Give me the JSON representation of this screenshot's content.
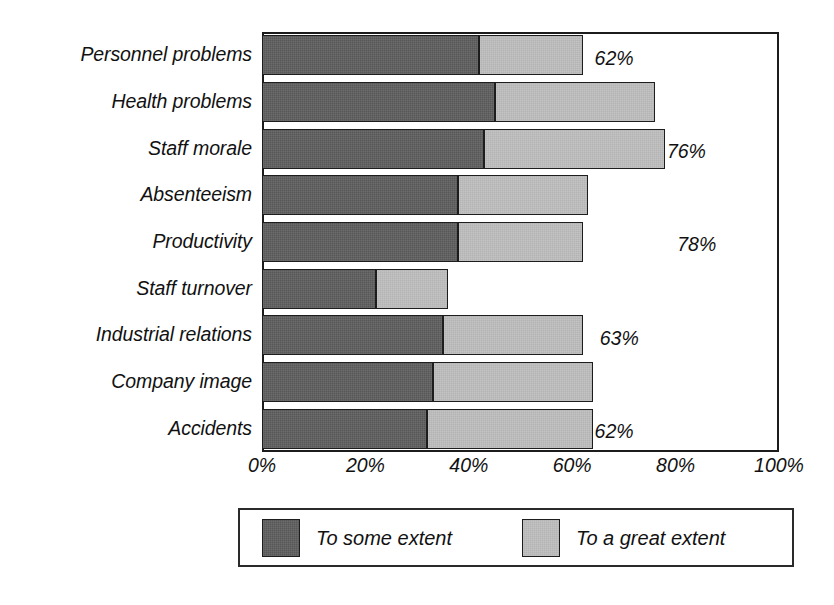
{
  "chart_data": {
    "type": "bar",
    "orientation": "horizontal",
    "stacked": true,
    "title": "",
    "subtitle": "",
    "xlabel": "",
    "ylabel": "",
    "xlim": [
      0,
      100
    ],
    "grid": false,
    "legend_position": "bottom",
    "categories": [
      "Personnel problems",
      "Health problems",
      "Staff morale",
      "Absenteeism",
      "Productivity",
      "Staff turnover",
      "Industrial relations",
      "Company image",
      "Accidents"
    ],
    "series": [
      {
        "name": "To some extent",
        "color": "#575757",
        "values": [
          42,
          45,
          43,
          38,
          38,
          22,
          35,
          33,
          32
        ]
      },
      {
        "name": "To a great extent",
        "color": "#b4b4b4",
        "values": [
          20,
          31,
          35,
          25,
          24,
          14,
          27,
          31,
          32
        ]
      }
    ],
    "totals": [
      62,
      76,
      78,
      63,
      62,
      36,
      62,
      64,
      64
    ],
    "data_labels": [
      "62%",
      "76%",
      "78%",
      "63%",
      "62%",
      "36%",
      "62%",
      "64%",
      "64 %"
    ],
    "xticks": [
      0,
      20,
      40,
      60,
      80,
      100
    ],
    "xtick_labels": [
      "0%",
      "20%",
      "40%",
      "60%",
      "80%",
      "100%"
    ]
  },
  "legend": {
    "items": [
      {
        "label": "To some extent",
        "color": "#575757"
      },
      {
        "label": "To a great extent",
        "color": "#b4b4b4"
      }
    ]
  },
  "colors": {
    "series_dark": "#575757",
    "series_light": "#b4b4b4",
    "frame": "#1c1c1c",
    "text": "#111111",
    "background": "#ffffff"
  }
}
